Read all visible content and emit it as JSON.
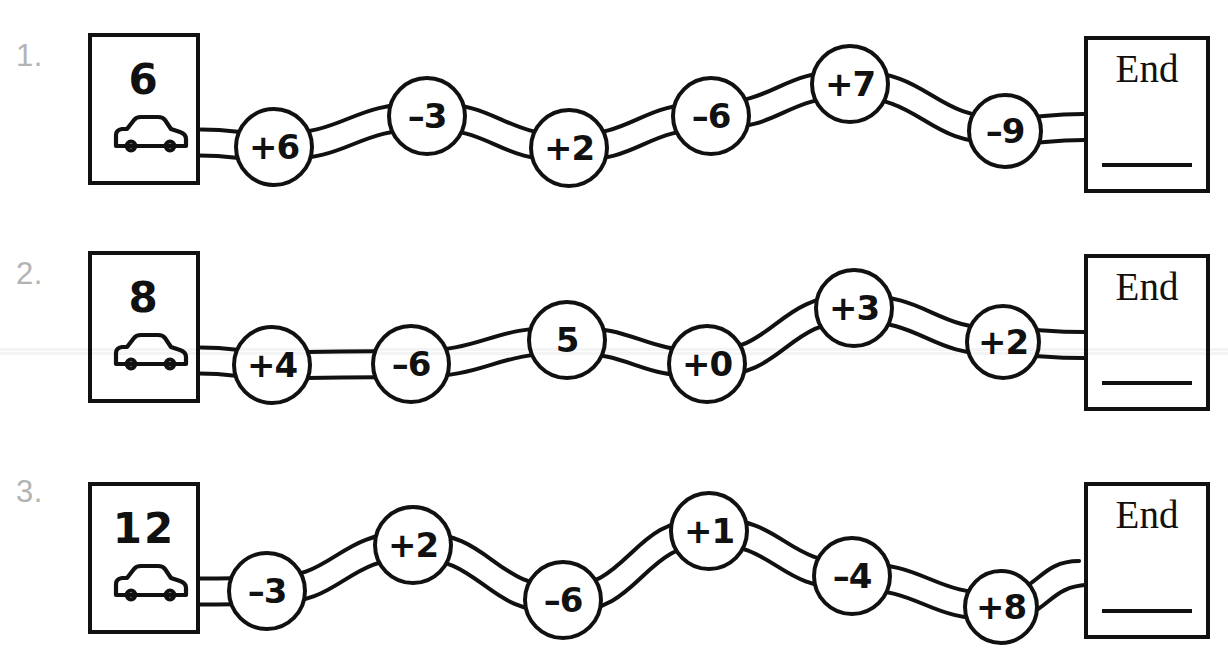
{
  "worksheet": {
    "title": "Addition and Subtraction Road Track Worksheet",
    "end_label": "End",
    "car_icon_name": "car-icon",
    "ink_color": "#111111",
    "number_color": "#b3b3b3",
    "paper_color": "#ffffff"
  },
  "problems": [
    {
      "number": "1.",
      "start_value": "6",
      "steps": [
        {
          "label": "+6"
        },
        {
          "label": "–3"
        },
        {
          "label": "+2"
        },
        {
          "label": "–6"
        },
        {
          "label": "+7"
        },
        {
          "label": "–9"
        }
      ],
      "end_label": "End",
      "answer": ""
    },
    {
      "number": "2.",
      "start_value": "8",
      "steps": [
        {
          "label": "+4"
        },
        {
          "label": "–6"
        },
        {
          "label": "5"
        },
        {
          "label": "+0"
        },
        {
          "label": "+3"
        },
        {
          "label": "+2"
        }
      ],
      "end_label": "End",
      "answer": ""
    },
    {
      "number": "3.",
      "start_value": "12",
      "steps": [
        {
          "label": "–3"
        },
        {
          "label": "+2"
        },
        {
          "label": "–6"
        },
        {
          "label": "+1"
        },
        {
          "label": "–4"
        },
        {
          "label": "+8"
        }
      ],
      "end_label": "End",
      "answer": ""
    }
  ],
  "layout": {
    "rows": [
      {
        "top": 0,
        "num_top": 40,
        "start_box": {
          "x": 88,
          "y": 33,
          "w": 112,
          "h": 152
        },
        "end_box": {
          "x": 1084,
          "y": 36,
          "w": 126,
          "h": 157
        },
        "circles": [
          {
            "cx": 274,
            "cy": 147,
            "r": 40
          },
          {
            "cx": 427,
            "cy": 116,
            "r": 40
          },
          {
            "cx": 569,
            "cy": 148,
            "r": 40
          },
          {
            "cx": 711,
            "cy": 116,
            "r": 40
          },
          {
            "cx": 850,
            "cy": 84,
            "r": 40
          },
          {
            "cx": 1005,
            "cy": 131,
            "r": 38
          }
        ]
      },
      {
        "top": 218,
        "num_top": 40,
        "start_box": {
          "x": 88,
          "y": 33,
          "w": 112,
          "h": 152
        },
        "end_box": {
          "x": 1084,
          "y": 36,
          "w": 126,
          "h": 157
        },
        "circles": [
          {
            "cx": 272,
            "cy": 147,
            "r": 40
          },
          {
            "cx": 411,
            "cy": 146,
            "r": 40
          },
          {
            "cx": 567,
            "cy": 122,
            "r": 40
          },
          {
            "cx": 707,
            "cy": 146,
            "r": 40
          },
          {
            "cx": 854,
            "cy": 90,
            "r": 40
          },
          {
            "cx": 1003,
            "cy": 124,
            "r": 38
          }
        ]
      },
      {
        "top": 436,
        "num_top": 40,
        "start_box": {
          "x": 88,
          "y": 46,
          "w": 112,
          "h": 152
        },
        "end_box": {
          "x": 1084,
          "y": 46,
          "w": 126,
          "h": 157
        },
        "circles": [
          {
            "cx": 267,
            "cy": 155,
            "r": 40
          },
          {
            "cx": 413,
            "cy": 109,
            "r": 40
          },
          {
            "cx": 563,
            "cy": 164,
            "r": 40
          },
          {
            "cx": 709,
            "cy": 95,
            "r": 40
          },
          {
            "cx": 852,
            "cy": 140,
            "r": 40
          },
          {
            "cx": 1001,
            "cy": 171,
            "r": 38
          }
        ]
      }
    ],
    "scan_bands": [
      {
        "top": 348
      },
      {
        "top": 352
      }
    ]
  }
}
